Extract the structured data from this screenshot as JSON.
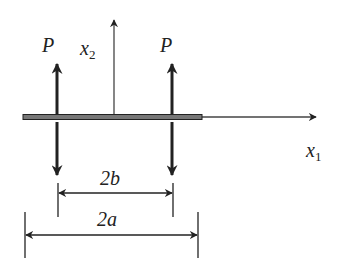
{
  "labels": {
    "force_left": "P",
    "force_right": "P",
    "axis_x2_base": "x",
    "axis_x2_sub": "2",
    "axis_x1_base": "x",
    "axis_x1_sub": "1",
    "dim_inner": "2b",
    "dim_outer": "2a"
  },
  "colors": {
    "ink": "#222222",
    "bar_fill": "#777777"
  }
}
